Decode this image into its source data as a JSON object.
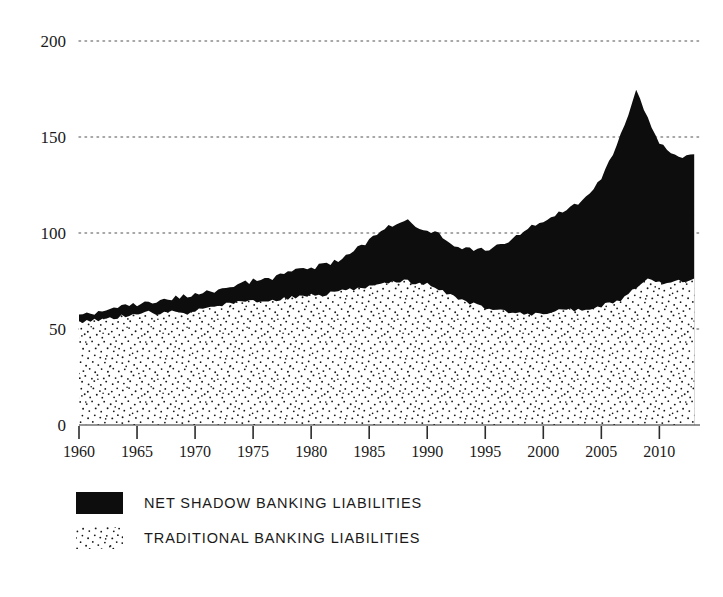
{
  "chart_data": {
    "type": "area",
    "stacked": true,
    "title": "",
    "subtitle": "",
    "xlabel": "",
    "ylabel": "",
    "xlim": [
      1960,
      2013.5
    ],
    "ylim": [
      0,
      200
    ],
    "grid": true,
    "grid_style": "dotted-horizontal",
    "legend_position": "below-left",
    "x_tick_labels": [
      "1960",
      "1965",
      "1970",
      "1975",
      "1980",
      "1985",
      "1990",
      "1995",
      "2000",
      "2005",
      "2010"
    ],
    "x_ticks": [
      1960,
      1965,
      1970,
      1975,
      1980,
      1985,
      1990,
      1995,
      2000,
      2005,
      2010
    ],
    "y_tick_labels": [
      "0",
      "50",
      "100",
      "150",
      "200"
    ],
    "y_ticks": [
      0,
      50,
      100,
      150,
      200
    ],
    "x": [
      1960,
      1961,
      1962,
      1963,
      1964,
      1965,
      1966,
      1967,
      1968,
      1969,
      1970,
      1971,
      1972,
      1973,
      1974,
      1975,
      1976,
      1977,
      1978,
      1979,
      1980,
      1981,
      1982,
      1983,
      1984,
      1985,
      1986,
      1987,
      1988,
      1989,
      1990,
      1991,
      1992,
      1993,
      1994,
      1995,
      1996,
      1997,
      1998,
      1999,
      2000,
      2001,
      2002,
      2003,
      2004,
      2005,
      2006,
      2007,
      2008,
      2009,
      2010,
      2011,
      2012,
      2013
    ],
    "series": [
      {
        "name": "TRADITIONAL BANKING LIABILITIES",
        "fill": "stipple",
        "color": "#ffffff",
        "pattern": "random-dots",
        "values": [
          53,
          54,
          55,
          56,
          57,
          58,
          59,
          58,
          59,
          58,
          59,
          61,
          62,
          63,
          64,
          64,
          64,
          65,
          66,
          67,
          68,
          68,
          69,
          70,
          71,
          72,
          73,
          74,
          75,
          74,
          73,
          71,
          68,
          65,
          63,
          61,
          60,
          59,
          58,
          58,
          58,
          59,
          60,
          60,
          61,
          62,
          64,
          66,
          72,
          76,
          74,
          74,
          75,
          77
        ]
      },
      {
        "name": "NET SHADOW BANKING LIABILITIES",
        "fill": "solid",
        "color": "#0d0d0d",
        "values": [
          4,
          4,
          4,
          4,
          5,
          5,
          5,
          7,
          7,
          9,
          9,
          8,
          8,
          9,
          10,
          11,
          12,
          12,
          13,
          14,
          14,
          15,
          16,
          18,
          21,
          24,
          28,
          30,
          32,
          30,
          29,
          28,
          27,
          27,
          28,
          30,
          33,
          37,
          41,
          45,
          48,
          50,
          52,
          56,
          60,
          66,
          77,
          90,
          103,
          84,
          73,
          68,
          65,
          63
        ]
      }
    ],
    "totals": [
      57,
      58,
      59,
      60,
      62,
      63,
      64,
      65,
      66,
      67,
      68,
      69,
      70,
      72,
      74,
      75,
      76,
      77,
      79,
      81,
      82,
      83,
      85,
      88,
      92,
      96,
      101,
      104,
      107,
      104,
      102,
      99,
      95,
      92,
      91,
      91,
      93,
      96,
      99,
      103,
      106,
      109,
      112,
      116,
      121,
      128,
      141,
      156,
      175,
      160,
      147,
      142,
      140,
      140
    ],
    "annotations": []
  },
  "legend": {
    "items": [
      {
        "label": "NET SHADOW BANKING LIABILITIES",
        "swatch": "solid-black"
      },
      {
        "label": "TRADITIONAL BANKING LIABILITIES",
        "swatch": "stipple-dots"
      }
    ]
  },
  "colors": {
    "shadow": "#0d0d0d",
    "traditional_dots": "#1a1a1a",
    "traditional_bg": "#ffffff",
    "axis": "#333333",
    "grid": "#808080",
    "text": "#1a1a1a",
    "background": "#ffffff"
  }
}
